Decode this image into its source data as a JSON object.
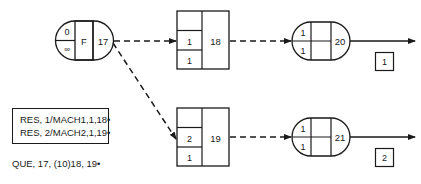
{
  "diagram": {
    "source_node": {
      "top_left": "0",
      "bottom_left": "∞",
      "middle": "F",
      "number": "17"
    },
    "activities": [
      {
        "number": "18",
        "rows": [
          "",
          "1",
          "1"
        ]
      },
      {
        "number": "19",
        "rows": [
          "",
          "2",
          "1"
        ]
      }
    ],
    "sink_nodes": [
      {
        "top_left": "1",
        "bottom_left": "1",
        "number": "20",
        "label": "1"
      },
      {
        "top_left": "1",
        "bottom_left": "1",
        "number": "21",
        "label": "2"
      }
    ],
    "resource_box": {
      "lines": [
        "RES, 1/MACH1,1,18•",
        "RES, 2/MACH2,1,19•"
      ]
    },
    "queue_statement": "QUE, 17, (10)18, 19•",
    "colors": {
      "line": "#1a1a1a",
      "background": "#ffffff"
    }
  }
}
